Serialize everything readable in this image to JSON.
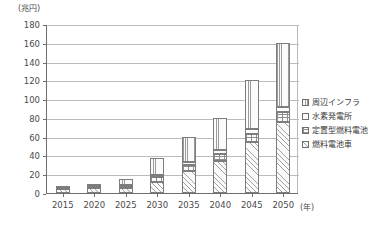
{
  "chart_data": {
    "type": "bar",
    "stacked": true,
    "title": "",
    "subtitle": "",
    "xlabel": "(年)",
    "ylabel": "(兆円)",
    "categories": [
      "2015",
      "2020",
      "2025",
      "2030",
      "2035",
      "2040",
      "2045",
      "2050"
    ],
    "ylim": [
      0,
      180
    ],
    "ytick_step": 20,
    "yticks": [
      "180",
      "160",
      "140",
      "120",
      "100",
      "80",
      "60",
      "40",
      "20",
      "0"
    ],
    "grid": true,
    "legend_position": "right",
    "series": [
      {
        "name": "周辺インフラ",
        "pattern": "vertical-lines",
        "values": [
          1,
          2,
          6,
          18,
          27,
          34,
          52,
          68
        ]
      },
      {
        "name": "水素発電所",
        "pattern": "plain",
        "values": [
          0,
          0,
          1,
          2,
          3,
          4,
          5,
          6
        ]
      },
      {
        "name": "定置型燃料電池",
        "pattern": "cross-hatch",
        "values": [
          1,
          2,
          3,
          5,
          7,
          8,
          9,
          10
        ]
      },
      {
        "name": "燃料電池車",
        "pattern": "diagonal-hatch",
        "values": [
          4,
          5,
          5,
          12,
          23,
          34,
          54,
          76
        ]
      }
    ],
    "totals": [
      6,
      9,
      15,
      37,
      60,
      80,
      120,
      160
    ]
  },
  "legend": {
    "items": [
      {
        "label": "周辺インフラ"
      },
      {
        "label": "水素発電所"
      },
      {
        "label": "定置型燃料電池"
      },
      {
        "label": "燃料電池車"
      }
    ]
  }
}
